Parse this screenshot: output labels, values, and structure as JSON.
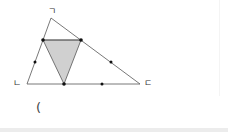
{
  "figure": {
    "vertex_labels": {
      "top": "ㄱ",
      "bottom_left": "ㄴ",
      "bottom_right": "ㄷ"
    },
    "answer_paren": "(",
    "colors": {
      "stroke": "#555555",
      "shade": "#d0d0d0",
      "dot": "#111111"
    }
  }
}
